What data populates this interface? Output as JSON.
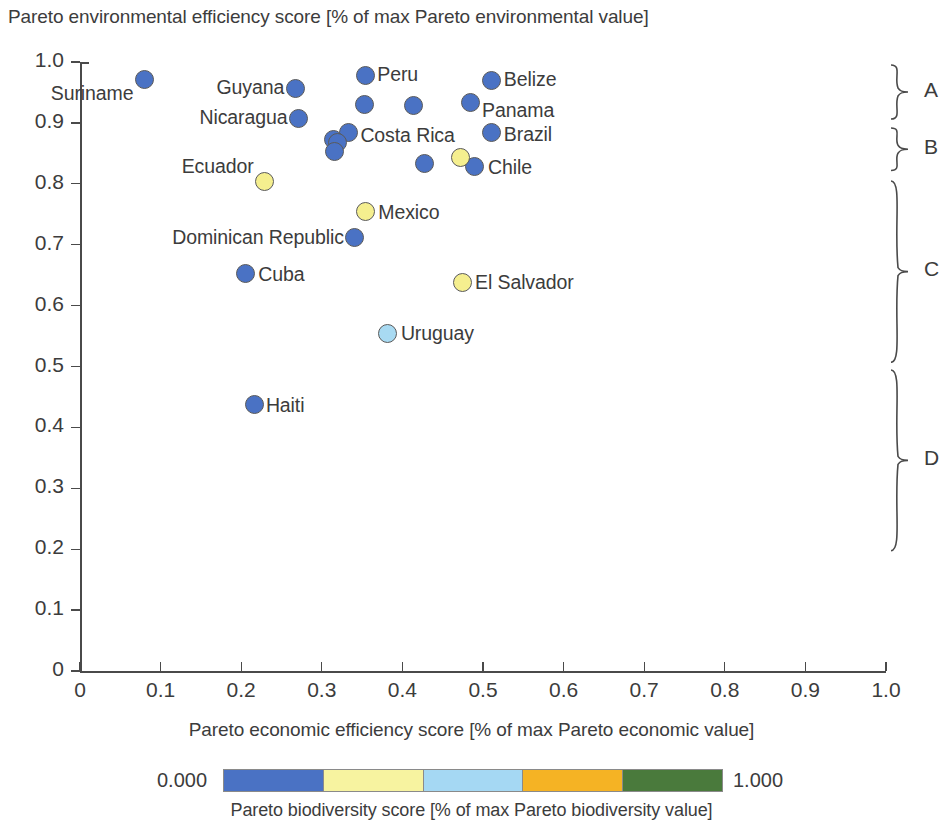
{
  "chart_data": {
    "type": "scatter",
    "title": "",
    "ylabel": "Pareto environmental efficiency score [% of max Pareto environmental value]",
    "xlabel": "Pareto economic efficiency score [% of max Pareto economic value]",
    "xlim": [
      0,
      1.0
    ],
    "ylim": [
      0,
      1.0
    ],
    "xticks": [
      "0",
      "0.1",
      "0.2",
      "0.3",
      "0.4",
      "0.5",
      "0.6",
      "0.7",
      "0.8",
      "0.9",
      "1.0"
    ],
    "xtick_values": [
      0,
      0.1,
      0.2,
      0.3,
      0.4,
      0.5,
      0.6,
      0.7,
      0.8,
      0.9,
      1.0
    ],
    "yticks": [
      "0",
      "0.1",
      "0.2",
      "0.3",
      "0.4",
      "0.5",
      "0.6",
      "0.7",
      "0.8",
      "0.9",
      "1.0"
    ],
    "ytick_values": [
      0,
      0.1,
      0.2,
      0.3,
      0.4,
      0.5,
      0.6,
      0.7,
      0.8,
      0.9,
      1.0
    ],
    "grid": false,
    "legend_position": "bottom",
    "colorbar": {
      "label": "Pareto biodiversity score [% of max Pareto biodiversity value]",
      "min_label": "0.000",
      "max_label": "1.000",
      "bands": [
        "#4a72c4",
        "#f7f3a0",
        "#a5d8f3",
        "#f5b324",
        "#4a7a3c"
      ]
    },
    "points": [
      {
        "name": "Suriname",
        "x": 0.08,
        "y": 0.972,
        "color": "#4a72c4",
        "label_dx": -108,
        "label_dy": 14,
        "labeled": true
      },
      {
        "name": "Guyana",
        "x": 0.267,
        "y": 0.957,
        "color": "#4a72c4",
        "label_dx": -84,
        "label_dy": -1,
        "labeled": true
      },
      {
        "name": "Peru",
        "x": 0.354,
        "y": 0.978,
        "color": "#4a72c4",
        "label_dx": 12,
        "label_dy": -1,
        "labeled": true
      },
      {
        "name": "Belize",
        "x": 0.511,
        "y": 0.97,
        "color": "#4a72c4",
        "label_dx": 12,
        "label_dy": -1,
        "labeled": true
      },
      {
        "name": "Nicaragua",
        "x": 0.271,
        "y": 0.908,
        "color": "#4a72c4",
        "label_dx": -110,
        "label_dy": -1,
        "labeled": true
      },
      {
        "name": "Panama",
        "x": 0.484,
        "y": 0.934,
        "color": "#4a72c4",
        "label_dx": 12,
        "label_dy": 8,
        "labeled": true
      },
      {
        "name": "unlabeled-1",
        "x": 0.353,
        "y": 0.93,
        "color": "#4a72c4",
        "label_dx": 0,
        "label_dy": 0,
        "labeled": false
      },
      {
        "name": "unlabeled-2",
        "x": 0.414,
        "y": 0.928,
        "color": "#4a72c4",
        "label_dx": 0,
        "label_dy": 0,
        "labeled": false
      },
      {
        "name": "Costa Rica",
        "x": 0.333,
        "y": 0.884,
        "color": "#4a72c4",
        "label_dx": 12,
        "label_dy": 2,
        "labeled": true
      },
      {
        "name": "Brazil",
        "x": 0.511,
        "y": 0.884,
        "color": "#4a72c4",
        "label_dx": 12,
        "label_dy": 1,
        "labeled": true
      },
      {
        "name": "unlabeled-3",
        "x": 0.314,
        "y": 0.873,
        "color": "#4a72c4",
        "label_dx": 0,
        "label_dy": 0,
        "labeled": false
      },
      {
        "name": "unlabeled-4",
        "x": 0.32,
        "y": 0.867,
        "color": "#4a72c4",
        "label_dx": 0,
        "label_dy": 0,
        "labeled": false
      },
      {
        "name": "unlabeled-5",
        "x": 0.316,
        "y": 0.853,
        "color": "#4a72c4",
        "label_dx": 0,
        "label_dy": 0,
        "labeled": false
      },
      {
        "name": "unlabeled-6",
        "x": 0.428,
        "y": 0.833,
        "color": "#4a72c4",
        "label_dx": 0,
        "label_dy": 0,
        "labeled": false
      },
      {
        "name": "Chile",
        "x": 0.49,
        "y": 0.829,
        "color": "#4a72c4",
        "label_dx": 13,
        "label_dy": 1,
        "labeled": true
      },
      {
        "name": "chile-pair-yellow",
        "x": 0.472,
        "y": 0.843,
        "color": "#f5ef8f",
        "label_dx": 0,
        "label_dy": 0,
        "labeled": false
      },
      {
        "name": "Ecuador",
        "x": 0.229,
        "y": 0.803,
        "color": "#f5ef8f",
        "label_dx": -96,
        "label_dy": -16,
        "labeled": true
      },
      {
        "name": "Mexico",
        "x": 0.354,
        "y": 0.754,
        "color": "#f5ef8f",
        "label_dx": 13,
        "label_dy": 0,
        "labeled": true
      },
      {
        "name": "Dominican Republic",
        "x": 0.341,
        "y": 0.712,
        "color": "#4a72c4",
        "label_dx": -205,
        "label_dy": 0,
        "labeled": true
      },
      {
        "name": "Cuba",
        "x": 0.205,
        "y": 0.652,
        "color": "#4a72c4",
        "label_dx": 13,
        "label_dy": 0,
        "labeled": true
      },
      {
        "name": "El Salvador",
        "x": 0.474,
        "y": 0.638,
        "color": "#f5ef8f",
        "label_dx": 13,
        "label_dy": 0,
        "labeled": true
      },
      {
        "name": "Uruguay",
        "x": 0.382,
        "y": 0.555,
        "color": "#a8daf2",
        "label_dx": 13,
        "label_dy": 0,
        "labeled": true
      },
      {
        "name": "Haiti",
        "x": 0.217,
        "y": 0.437,
        "color": "#4a72c4",
        "label_dx": 11,
        "label_dy": 0,
        "labeled": true
      }
    ],
    "annotations": [
      {
        "label": "A",
        "y_top": 0.997,
        "y_bottom": 0.905
      },
      {
        "label": "B",
        "y_top": 0.893,
        "y_bottom": 0.82
      },
      {
        "label": "C",
        "y_top": 0.807,
        "y_bottom": 0.506
      },
      {
        "label": "D",
        "y_top": 0.496,
        "y_bottom": 0.196
      }
    ]
  }
}
